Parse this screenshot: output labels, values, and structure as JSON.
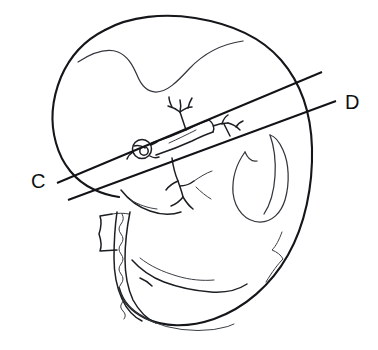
{
  "figure": {
    "background_color": "#ffffff",
    "ink_color": "#14161a",
    "width": 378,
    "height": 350,
    "style": "black-and-white line drawing"
  },
  "labels": {
    "plane_c": "C",
    "plane_d": "D"
  },
  "section_planes": [
    {
      "id": "plane-c",
      "label": "C",
      "label_x": 36,
      "label_y": 182,
      "line_x1": 57,
      "line_y1": 183,
      "line_x2": 322,
      "line_y2": 72
    },
    {
      "id": "plane-d",
      "label": "D",
      "label_x": 348,
      "label_y": 104,
      "line_x1": 68,
      "line_y1": 200,
      "line_x2": 336,
      "line_y2": 101
    }
  ],
  "structures": [
    {
      "name": "body-outline",
      "description": "overall embryo body silhouette"
    },
    {
      "name": "head-fold-inner-line",
      "description": "inner curved line of cranial region"
    },
    {
      "name": "vessel-cross-section-circle",
      "description": "small circle with inner mark at hilum"
    },
    {
      "name": "branching-vessel-upper",
      "description": "branching vessel tree above the trunk"
    },
    {
      "name": "branching-vessel-lower",
      "description": "branching vessel tree below the trunk"
    },
    {
      "name": "central-trunk",
      "description": "elongated tubular trunk structure"
    },
    {
      "name": "limb-bud-loop",
      "description": "teardrop loop on the right side"
    },
    {
      "name": "tail-groove-line",
      "description": "faint groove line right of limb loop"
    },
    {
      "name": "cord-stalk",
      "description": "wavy cord / stalk running to lower border"
    },
    {
      "name": "cord-collar-box",
      "description": "small rectangular collar at the cord base"
    },
    {
      "name": "lower-fold",
      "description": "large lower body fold curve"
    },
    {
      "name": "lower-margin-wavy",
      "description": "wavy margin along the lower-left border"
    }
  ]
}
